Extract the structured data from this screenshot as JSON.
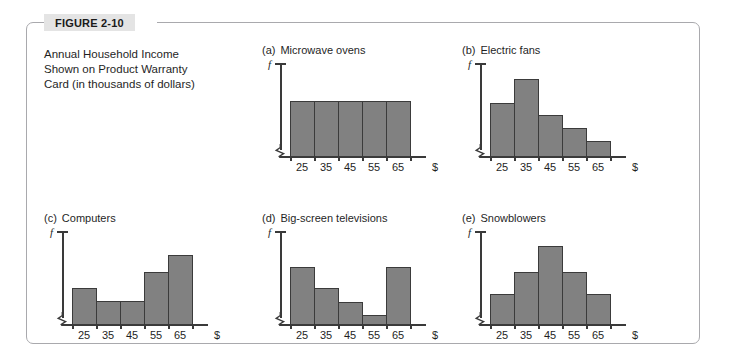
{
  "figure": {
    "number_label": "FIGURE 2-10",
    "caption_lines": [
      "Annual Household Income",
      "Shown on Product Warranty",
      "Card (in thousands of dollars)"
    ]
  },
  "axis": {
    "y_label": "f",
    "x_unit_symbol": "$",
    "tick_labels": [
      "25",
      "35",
      "45",
      "55",
      "65"
    ]
  },
  "colors": {
    "bar_fill": "#818181",
    "bar_stroke": "#3b3b3b",
    "axis": "#3a3a3a",
    "frame": "#a9a9ad",
    "tab_background": "#e4e4e4",
    "text": "#1f1f1f"
  },
  "chart_data": [
    {
      "type": "bar",
      "panel": "a",
      "title": "Microwave ovens",
      "title_letter": "(a)",
      "categories": [
        "25",
        "35",
        "45",
        "55",
        "65"
      ],
      "values": [
        60,
        60,
        60,
        60,
        60
      ],
      "xlabel": "$",
      "ylabel": "f",
      "ylim": [
        0,
        100
      ],
      "shape": "uniform",
      "grid": false,
      "legend": "none"
    },
    {
      "type": "bar",
      "panel": "b",
      "title": "Electric fans",
      "title_letter": "(b)",
      "categories": [
        "25",
        "35",
        "45",
        "55",
        "65"
      ],
      "values": [
        58,
        84,
        45,
        31,
        17
      ],
      "xlabel": "$",
      "ylabel": "f",
      "ylim": [
        0,
        100
      ],
      "shape": "skewed-right",
      "grid": false,
      "legend": "none"
    },
    {
      "type": "bar",
      "panel": "c",
      "title": "Computers",
      "title_letter": "(c)",
      "categories": [
        "25",
        "35",
        "45",
        "55",
        "65"
      ],
      "values": [
        40,
        25,
        25,
        57,
        75
      ],
      "xlabel": "$",
      "ylabel": "f",
      "ylim": [
        0,
        100
      ],
      "shape": "skewed-left",
      "grid": false,
      "legend": "none"
    },
    {
      "type": "bar",
      "panel": "d",
      "title": "Big-screen televisions",
      "title_letter": "(d)",
      "categories": [
        "25",
        "35",
        "45",
        "55",
        "65"
      ],
      "values": [
        62,
        40,
        24,
        10,
        62
      ],
      "xlabel": "$",
      "ylabel": "f",
      "ylim": [
        0,
        100
      ],
      "shape": "bimodal",
      "grid": false,
      "legend": "none"
    },
    {
      "type": "bar",
      "panel": "e",
      "title": "Snowblowers",
      "title_letter": "(e)",
      "categories": [
        "25",
        "35",
        "45",
        "55",
        "65"
      ],
      "values": [
        33,
        57,
        85,
        57,
        33
      ],
      "xlabel": "$",
      "ylabel": "f",
      "ylim": [
        0,
        100
      ],
      "shape": "symmetric",
      "grid": false,
      "legend": "none"
    }
  ]
}
